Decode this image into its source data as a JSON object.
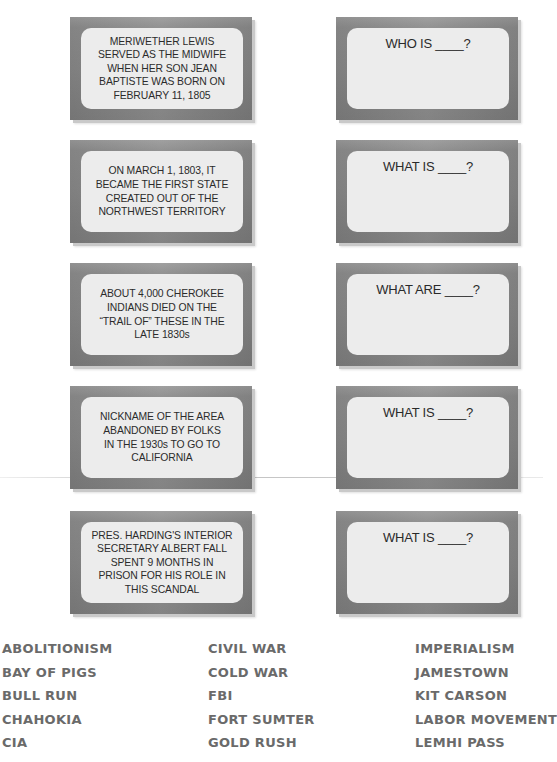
{
  "clue_cards": [
    {
      "clue": "MERIWETHER LEWIS SERVED AS THE MIDWIFE WHEN HER SON JEAN BAPTISTE WAS BORN ON FEBRUARY 11, 1805",
      "lines": [
        "MERIWETHER LEWIS",
        "SERVED AS THE MIDWIFE",
        "WHEN HER SON JEAN",
        "BAPTISTE WAS BORN ON",
        "FEBRUARY 11, 1805"
      ]
    },
    {
      "clue": "ON MARCH 1, 1803, IT BECAME THE FIRST STATE CREATED OUT OF THE NORTHWEST TERRITORY",
      "lines": [
        "ON MARCH 1, 1803, IT",
        "BECAME THE FIRST STATE",
        "CREATED OUT OF THE",
        "NORTHWEST TERRITORY"
      ]
    },
    {
      "clue": "ABOUT 4,000 CHEROKEE INDIANS DIED ON THE “TRAIL OF” THESE IN THE LATE 1830s",
      "lines": [
        "ABOUT 4,000 CHEROKEE",
        "INDIANS DIED ON THE",
        "“TRAIL OF” THESE IN THE",
        "LATE 1830s"
      ]
    },
    {
      "clue": "NICKNAME OF THE AREA ABANDONED BY FOLKS IN THE 1930s TO GO TO CALIFORNIA",
      "lines": [
        "NICKNAME OF THE AREA",
        "ABANDONED BY FOLKS",
        "IN THE 1930s TO GO TO",
        "CALIFORNIA"
      ]
    },
    {
      "clue": "PRES. HARDING'S INTERIOR SECRETARY ALBERT FALL SPENT 9 MONTHS IN PRISON FOR HIS ROLE IN THIS SCANDAL",
      "lines": [
        "PRES. HARDING'S INTERIOR",
        "SECRETARY ALBERT FALL",
        "SPENT 9 MONTHS IN",
        "PRISON FOR HIS ROLE IN",
        "THIS SCANDAL"
      ]
    }
  ],
  "answer_cards": [
    {
      "prompt": "WHO IS ____?"
    },
    {
      "prompt": "WHAT IS ____?"
    },
    {
      "prompt": "WHAT ARE ____?"
    },
    {
      "prompt": "WHAT IS ____?"
    },
    {
      "prompt": "WHAT IS ____?"
    }
  ],
  "word_bank": {
    "columns": [
      [
        "ABOLITIONISM",
        "BAY OF PIGS",
        "BULL RUN",
        "CHAHOKIA",
        "CIA"
      ],
      [
        "CIVIL WAR",
        "COLD WAR",
        "FBI",
        "FORT SUMTER",
        "GOLD RUSH"
      ],
      [
        "IMPERIALISM",
        "JAMESTOWN",
        "KIT CARSON",
        "LABOR MOVEMENT",
        "LEMHI PASS"
      ]
    ]
  },
  "colors": {
    "card_frame": "#878787",
    "card_panel": "#ececec",
    "card_text": "#2b2b2b",
    "word_bank_text": "#6a6a6a"
  }
}
